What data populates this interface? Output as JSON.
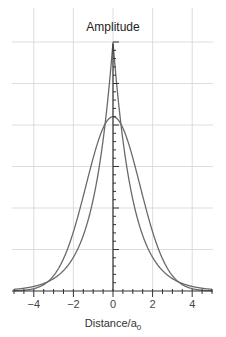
{
  "chart_data": {
    "type": "line",
    "title": "Amplitude",
    "xlabel": "Distance/a0",
    "xlabel_main": "Distance/a",
    "xlabel_sub": "0",
    "ylabel": "",
    "xlim": [
      -5,
      5
    ],
    "ylim": [
      0,
      1
    ],
    "x_ticks": [
      -4,
      -2,
      0,
      2,
      4
    ],
    "x_tick_labels": [
      "−4",
      "−2",
      "0",
      "2",
      "4"
    ],
    "grid": true,
    "legend": null,
    "series": [
      {
        "name": "Slater-type (exponential) cusp",
        "shape": "exp(-|x|)",
        "x": [
          -5,
          -4,
          -3,
          -2,
          -1,
          -0.5,
          0,
          0.5,
          1,
          2,
          3,
          4,
          5
        ],
        "values": [
          0.007,
          0.018,
          0.05,
          0.135,
          0.368,
          0.607,
          1.0,
          0.607,
          0.368,
          0.135,
          0.05,
          0.018,
          0.007
        ]
      },
      {
        "name": "Gaussian-type",
        "shape": "0.7*exp(-0.27*x^2)",
        "x": [
          -5,
          -4,
          -3,
          -2,
          -1,
          -0.5,
          0,
          0.5,
          1,
          2,
          3,
          4,
          5
        ],
        "values": [
          0.0,
          0.009,
          0.062,
          0.238,
          0.534,
          0.655,
          0.7,
          0.655,
          0.534,
          0.238,
          0.062,
          0.009,
          0.0
        ]
      }
    ]
  }
}
